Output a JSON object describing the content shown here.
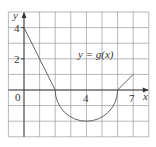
{
  "chart_data": {
    "type": "line",
    "title": "",
    "function_label": "y = g(x)",
    "xlabel": "x",
    "ylabel": "y",
    "xlim": [
      -1,
      8
    ],
    "ylim": [
      -3,
      5
    ],
    "grid": true,
    "grid_step": 1,
    "x_tick_labels": [
      {
        "value": 0,
        "label": "0"
      },
      {
        "value": 4,
        "label": "4"
      },
      {
        "value": 7,
        "label": "7"
      }
    ],
    "y_tick_labels": [
      {
        "value": 2,
        "label": "2"
      },
      {
        "value": 4,
        "label": "4"
      }
    ],
    "pieces": [
      {
        "kind": "segment",
        "from": [
          0,
          4
        ],
        "to": [
          2,
          0
        ]
      },
      {
        "kind": "lower-semicircle",
        "center": [
          4,
          0
        ],
        "radius": 2,
        "from": [
          2,
          0
        ],
        "to": [
          6,
          0
        ]
      },
      {
        "kind": "segment",
        "from": [
          6,
          0
        ],
        "to": [
          7,
          1
        ]
      }
    ],
    "x": [
      0,
      1,
      2,
      3,
      4,
      5,
      6,
      7
    ],
    "series": [
      {
        "name": "g(x)",
        "values": [
          4,
          2,
          0,
          -1.732,
          -2,
          -1.732,
          0,
          1
        ]
      }
    ],
    "colors": {
      "grid": "#9a9a9a",
      "axis": "#333333",
      "curve": "#555555"
    }
  },
  "labels": {
    "function": "y = g(x)",
    "x_axis": "x",
    "y_axis": "y",
    "origin": "0",
    "x4": "4",
    "x7": "7",
    "y2": "2",
    "y4": "4"
  }
}
